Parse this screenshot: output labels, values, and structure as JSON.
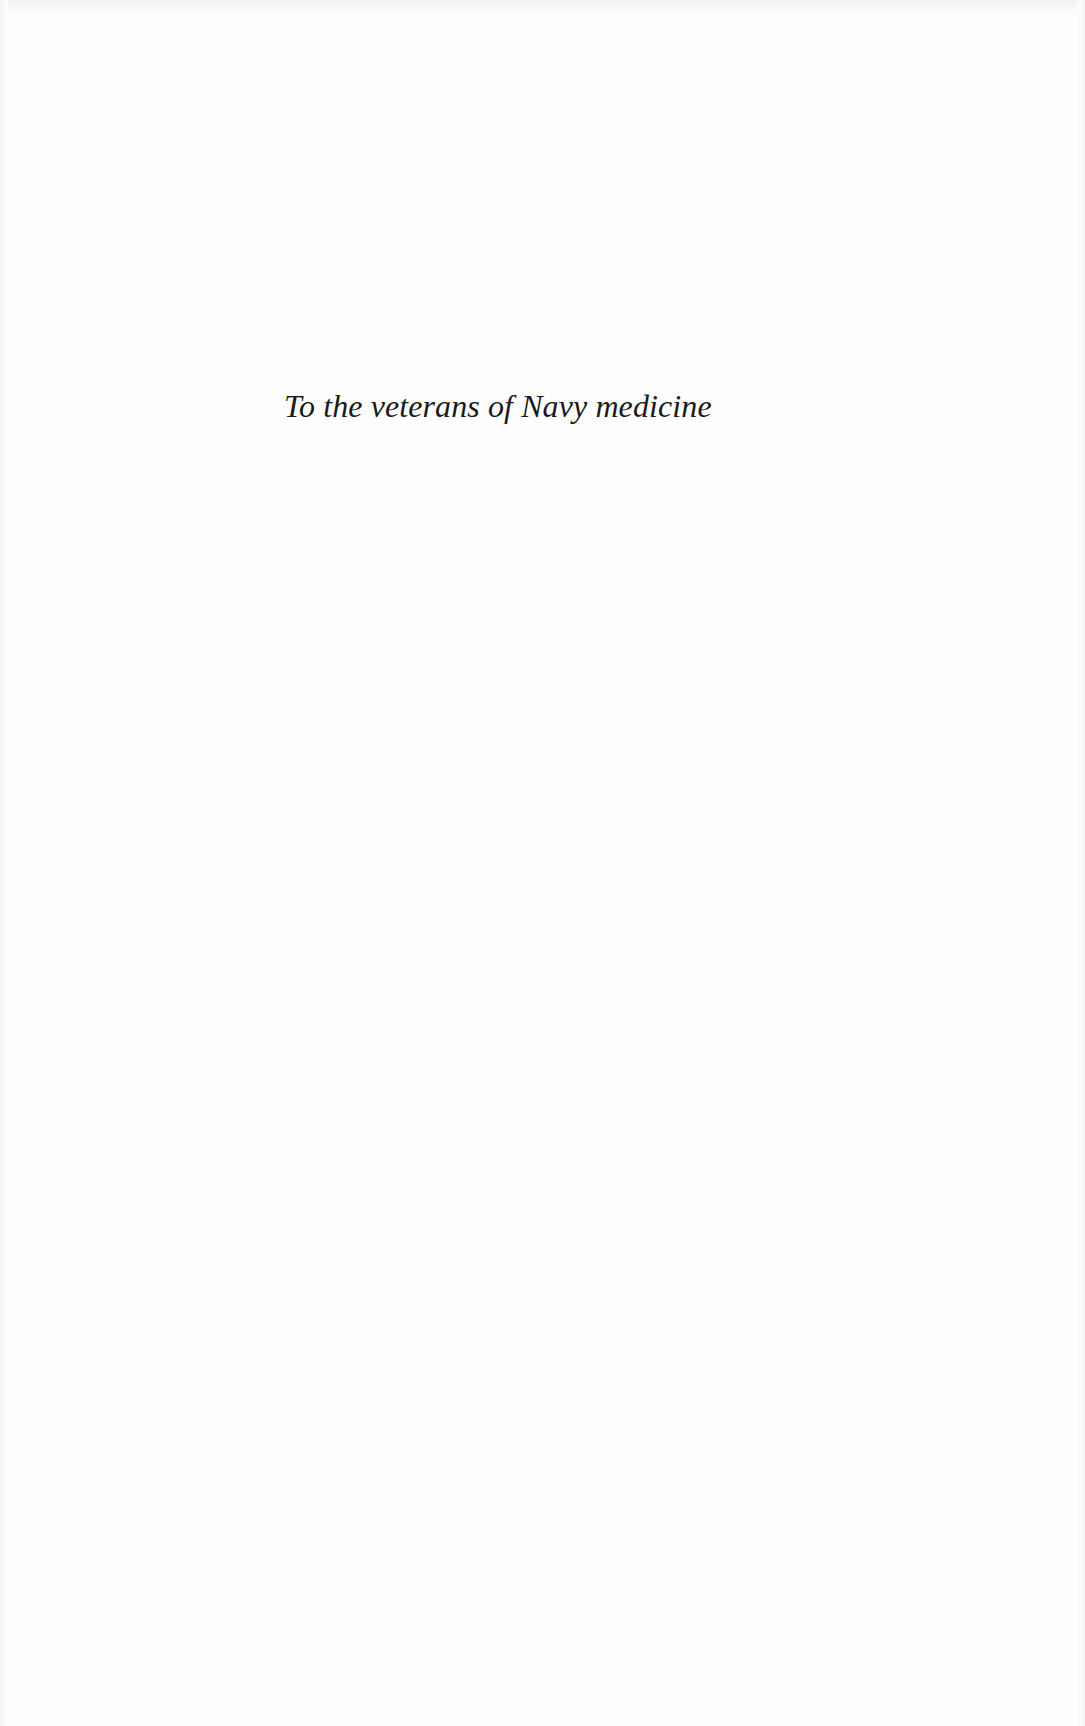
{
  "page": {
    "dedication": "To the veterans of Navy medicine",
    "background_color": "#fefefe",
    "text_color": "#1a1a1a"
  }
}
